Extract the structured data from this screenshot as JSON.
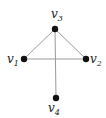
{
  "graph": {
    "nodes": [
      {
        "id": "v1",
        "base": "v",
        "sub": "1",
        "x": 24,
        "y": 59,
        "lx": 7,
        "ly": 63
      },
      {
        "id": "v2",
        "base": "v",
        "sub": "2",
        "x": 86,
        "y": 59,
        "lx": 90,
        "ly": 63
      },
      {
        "id": "v3",
        "base": "v",
        "sub": "3",
        "x": 55,
        "y": 29,
        "lx": 51,
        "ly": 18
      },
      {
        "id": "v4",
        "base": "v",
        "sub": "4",
        "x": 56,
        "y": 98,
        "lx": 48,
        "ly": 112
      }
    ],
    "edges": [
      [
        "v1",
        "v3"
      ],
      [
        "v3",
        "v2"
      ],
      [
        "v1",
        "v2"
      ],
      [
        "v3",
        "v4"
      ]
    ],
    "colors": {
      "edge": "#9a9a9a",
      "node": "#111111",
      "label": "#222222"
    }
  }
}
